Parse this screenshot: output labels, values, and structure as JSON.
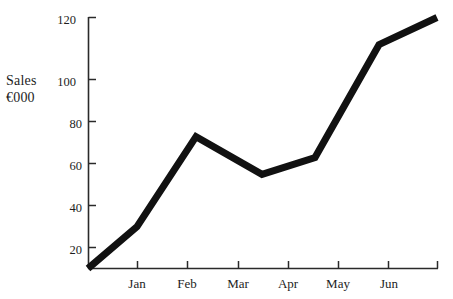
{
  "chart_data": {
    "type": "line",
    "title": "",
    "subtitle": "",
    "ylabel_lines": [
      "Sales",
      "€000"
    ],
    "xlabel": "",
    "ylabel": "Sales €000",
    "categories": [
      "",
      "Jan",
      "Feb",
      "Mar",
      "Apr",
      "May",
      "Jun",
      ""
    ],
    "x_tick_labels": [
      "Jan",
      "Feb",
      "Mar",
      "Apr",
      "May",
      "Jun"
    ],
    "y_tick_labels": [
      "20",
      "40",
      "60",
      "80",
      "100",
      "120"
    ],
    "y_ticks": [
      20,
      40,
      60,
      80,
      100,
      120
    ],
    "ylim": [
      0,
      120
    ],
    "grid": false,
    "legend": false,
    "legend_position": "none",
    "series": [
      {
        "name": "Sales",
        "color": "#111111",
        "line_width": 7,
        "x": [
          0,
          1,
          2,
          3,
          4,
          5,
          6,
          7
        ],
        "values": [
          0,
          20,
          63,
          45,
          53,
          107,
          120,
          120
        ],
        "points": [
          {
            "label": "start",
            "x_px": 88,
            "value": 0
          },
          {
            "label": "Jan",
            "x_px": 137,
            "value": 20
          },
          {
            "label": "Feb",
            "x_px": 196,
            "value": 63
          },
          {
            "label": "Mar",
            "x_px": 262,
            "value": 45
          },
          {
            "label": "Apr",
            "x_px": 315,
            "value": 53
          },
          {
            "label": "May",
            "x_px": 379,
            "value": 107
          },
          {
            "label": "Jun",
            "x_px": 437,
            "value": 120
          }
        ]
      }
    ]
  },
  "axes": {
    "y_axis_color": "#2a2a2a",
    "x_axis_color": "#2a2a2a",
    "background": "#ffffff"
  }
}
